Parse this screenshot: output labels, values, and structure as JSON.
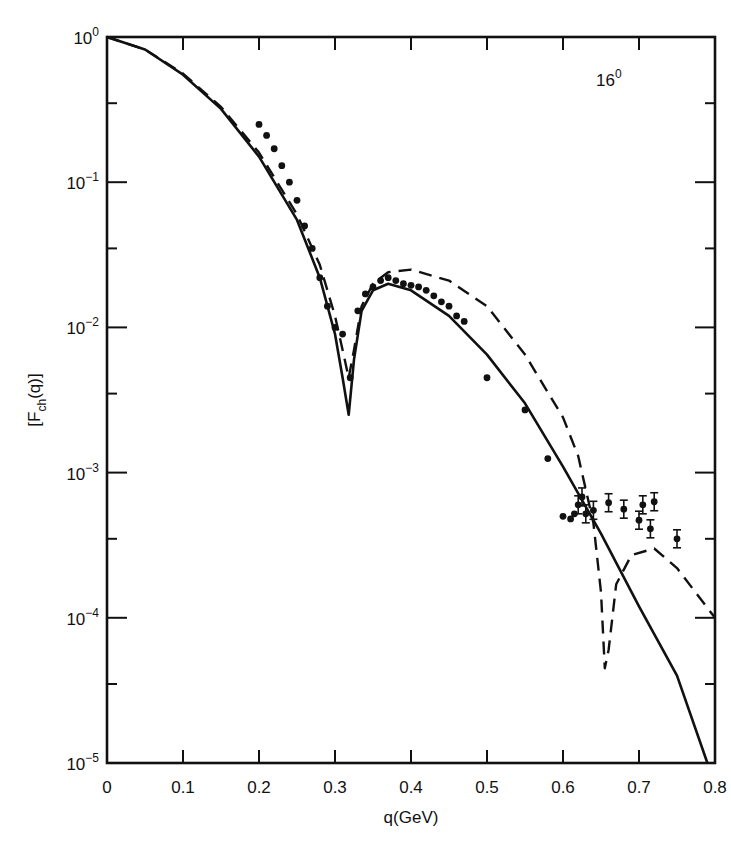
{
  "chart_data": {
    "type": "line",
    "title": "",
    "annotation": {
      "text": "16",
      "sup": "0",
      "note": "16O nucleus label, top right"
    },
    "xlabel": "q(GeV)",
    "ylabel": "[F",
    "ylabel_sub": "ch",
    "ylabel_tail": "(q)]",
    "xscale": "linear",
    "yscale": "log",
    "xlim": [
      0,
      0.8
    ],
    "ylim": [
      1e-05,
      1
    ],
    "grid": false,
    "legend": null,
    "x_ticks": [
      "0",
      "0.1",
      "0.2",
      "0.3",
      "0.4",
      "0.5",
      "0.6",
      "0.7",
      "0.8"
    ],
    "y_ticks": [
      {
        "base": "10",
        "exp": "0",
        "value": 1
      },
      {
        "base": "10",
        "exp": "−1",
        "value": 0.1
      },
      {
        "base": "10",
        "exp": "−2",
        "value": 0.01
      },
      {
        "base": "10",
        "exp": "−3",
        "value": 0.001
      },
      {
        "base": "10",
        "exp": "−4",
        "value": 0.0001
      },
      {
        "base": "10",
        "exp": "−5",
        "value": 1e-05
      }
    ],
    "series": [
      {
        "name": "solid-theory",
        "style": "solid",
        "x": [
          0,
          0.05,
          0.1,
          0.15,
          0.2,
          0.25,
          0.28,
          0.3,
          0.31,
          0.318,
          0.325,
          0.335,
          0.35,
          0.37,
          0.4,
          0.45,
          0.5,
          0.55,
          0.6,
          0.65,
          0.7,
          0.75,
          0.79
        ],
        "y": [
          1,
          0.82,
          0.55,
          0.32,
          0.15,
          0.055,
          0.022,
          0.009,
          0.0045,
          0.0025,
          0.006,
          0.013,
          0.018,
          0.02,
          0.018,
          0.012,
          0.0065,
          0.003,
          0.0011,
          0.00038,
          0.00012,
          4e-05,
          1e-05
        ]
      },
      {
        "name": "dashed-theory",
        "style": "dashed",
        "x": [
          0,
          0.05,
          0.1,
          0.15,
          0.2,
          0.25,
          0.28,
          0.3,
          0.31,
          0.318,
          0.325,
          0.335,
          0.35,
          0.37,
          0.4,
          0.45,
          0.5,
          0.55,
          0.6,
          0.62,
          0.64,
          0.65,
          0.655,
          0.66,
          0.67,
          0.69,
          0.72,
          0.75,
          0.8
        ],
        "y": [
          1,
          0.82,
          0.56,
          0.33,
          0.16,
          0.06,
          0.027,
          0.012,
          0.007,
          0.0045,
          0.007,
          0.014,
          0.02,
          0.024,
          0.025,
          0.021,
          0.014,
          0.0065,
          0.0024,
          0.0013,
          0.00045,
          0.00015,
          4.5e-05,
          6e-05,
          0.00017,
          0.00027,
          0.0003,
          0.00022,
          0.0001
        ]
      },
      {
        "name": "experimental-data",
        "style": "points",
        "x": [
          0.2,
          0.21,
          0.22,
          0.23,
          0.24,
          0.25,
          0.26,
          0.27,
          0.28,
          0.29,
          0.3,
          0.31,
          0.32,
          0.33,
          0.34,
          0.35,
          0.36,
          0.37,
          0.38,
          0.39,
          0.4,
          0.41,
          0.42,
          0.43,
          0.44,
          0.45,
          0.46,
          0.47,
          0.5,
          0.55,
          0.58,
          0.6,
          0.61,
          0.615,
          0.62,
          0.625,
          0.63,
          0.64,
          0.66,
          0.68,
          0.7,
          0.705,
          0.715,
          0.72,
          0.75
        ],
        "y": [
          0.25,
          0.21,
          0.17,
          0.13,
          0.1,
          0.075,
          0.05,
          0.035,
          0.022,
          0.014,
          0.01,
          0.009,
          0.0045,
          0.013,
          0.017,
          0.019,
          0.021,
          0.022,
          0.021,
          0.02,
          0.0195,
          0.019,
          0.018,
          0.0165,
          0.015,
          0.014,
          0.012,
          0.011,
          0.0045,
          0.0027,
          0.00125,
          0.0005,
          0.00048,
          0.00052,
          0.0006,
          0.00068,
          0.00052,
          0.00055,
          0.00062,
          0.00056,
          0.00047,
          0.0006,
          0.00041,
          0.00063,
          0.00035
        ]
      }
    ]
  }
}
